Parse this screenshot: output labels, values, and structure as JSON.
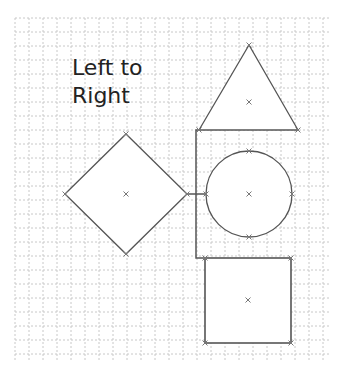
{
  "diagram": {
    "title_line1": "Left to",
    "title_line2": "Right",
    "grid": {
      "x0": 15,
      "y0": 18,
      "x1": 330,
      "y1": 362,
      "step": 14,
      "color": "#c8c8c8"
    },
    "stroke_color": "#555555",
    "marker_color": "#777777",
    "shapes": [
      {
        "id": "diamond",
        "type": "diamond",
        "cx": 126,
        "cy": 194,
        "rx": 61,
        "ry": 60
      },
      {
        "id": "triangle",
        "type": "triangle",
        "points": [
          [
            249,
            45
          ],
          [
            199,
            130
          ],
          [
            298,
            130
          ]
        ],
        "center": [
          249,
          102
        ]
      },
      {
        "id": "circle",
        "type": "circle",
        "cx": 249,
        "cy": 194,
        "r": 43
      },
      {
        "id": "square",
        "type": "rect",
        "x": 205,
        "y": 258,
        "w": 86,
        "h": 85,
        "center": [
          248,
          300
        ]
      }
    ],
    "connector": {
      "from": "diamond",
      "to": [
        "triangle",
        "circle",
        "square"
      ],
      "direction": "left-to-right"
    }
  }
}
